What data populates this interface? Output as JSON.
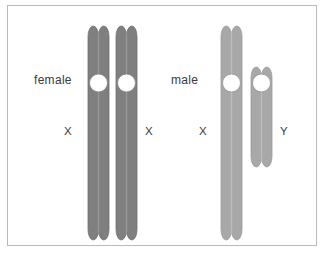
{
  "figure": {
    "type": "diagram",
    "background_color": "#ffffff",
    "frame_color": "#b9b9b9"
  },
  "labels": {
    "female": "female",
    "male": "male",
    "female_chrom_1": "X",
    "female_chrom_2": "X",
    "male_chrom_1": "X",
    "male_chrom_2": "Y",
    "text_color": "#3a3a3a"
  },
  "chromosomes": [
    {
      "id": "female-x-1",
      "label": "X",
      "group": "female",
      "fill": "#7f7f7f",
      "edge": "#6e6e6e",
      "chromatid_divider": "#979797",
      "centromere_fill": "#ffffff",
      "centromere_edge": "#8a8a8a",
      "x": 79,
      "y": 19,
      "width": 21,
      "height": 214,
      "centromere_center_y": 76,
      "centromere_radius": 9
    },
    {
      "id": "female-x-2",
      "label": "X",
      "group": "female",
      "fill": "#7f7f7f",
      "edge": "#6e6e6e",
      "chromatid_divider": "#979797",
      "centromere_fill": "#ffffff",
      "centromere_edge": "#8a8a8a",
      "x": 107,
      "y": 19,
      "width": 21,
      "height": 214,
      "centromere_center_y": 76,
      "centromere_radius": 9
    },
    {
      "id": "male-x",
      "label": "X",
      "group": "male",
      "fill": "#a8a8a8",
      "edge": "#9a9a9a",
      "chromatid_divider": "#bcbcbc",
      "centromere_fill": "#ffffff",
      "centromere_edge": "#9a9a9a",
      "x": 212,
      "y": 19,
      "width": 21,
      "height": 214,
      "centromere_center_y": 76,
      "centromere_radius": 9
    },
    {
      "id": "male-y",
      "label": "Y",
      "group": "male",
      "fill": "#a8a8a8",
      "edge": "#9a9a9a",
      "chromatid_divider": "#bcbcbc",
      "centromere_fill": "#ffffff",
      "centromere_edge": "#9a9a9a",
      "x": 242,
      "y": 60,
      "width": 21,
      "height": 100,
      "centromere_center_y": 76,
      "centromere_radius": 9
    }
  ],
  "label_positions": {
    "female": {
      "x": 26,
      "y": 68
    },
    "male": {
      "x": 163,
      "y": 68
    },
    "female_x1": {
      "x": 56,
      "y": 120
    },
    "female_x2": {
      "x": 137,
      "y": 120
    },
    "male_x": {
      "x": 191,
      "y": 120
    },
    "male_y": {
      "x": 272,
      "y": 120
    }
  }
}
